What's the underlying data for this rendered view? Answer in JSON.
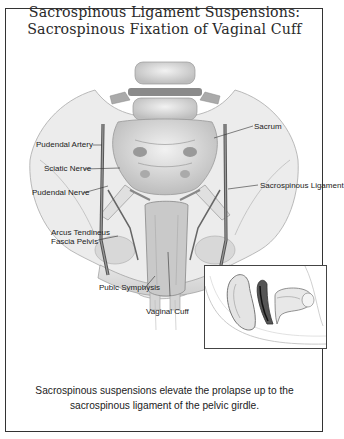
{
  "figure": {
    "title_line1": "Sacrospinous Ligament Suspensions:",
    "title_line2": "Sacrospinous Fixation of Vaginal Cuff",
    "caption_line1": "Sacrospinous suspensions elevate the prolapse up to the",
    "caption_line2": "sacrospinous ligament of the pelvic girdle.",
    "labels": {
      "pudendal_artery": "Pudendal Artery",
      "sciatic_nerve": "Sciatic Nerve",
      "pudendal_nerve": "Pudendal Nerve",
      "arcus_line1": "Arcus Tendineus",
      "arcus_line2": "Fascia Pelvis",
      "pubic_symphysis": "Pubic Symphysis",
      "vaginal_cuff": "Vaginal Cuff",
      "sacrum": "Sacrum",
      "sacrospinous_ligament": "Sacrospinous Ligament"
    },
    "inset": "sagittal-pelvis-view"
  }
}
